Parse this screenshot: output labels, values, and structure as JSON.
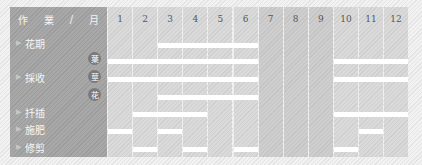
{
  "chart_data": {
    "type": "gantt",
    "title": "",
    "header_label": [
      "作",
      "業",
      "/",
      "月"
    ],
    "months": [
      "1",
      "2",
      "3",
      "4",
      "5",
      "6",
      "7",
      "8",
      "9",
      "10",
      "11",
      "12"
    ],
    "shaded_months": [
      7,
      8,
      9
    ],
    "rows": [
      {
        "task": "花期",
        "sub": "",
        "y": 36,
        "months": [
          3,
          4,
          5,
          6
        ]
      },
      {
        "task": "採收",
        "sub": "葉",
        "y": 52,
        "months": [
          1,
          2,
          3,
          4,
          5,
          6,
          10,
          11,
          12
        ]
      },
      {
        "task": "",
        "sub": "莖",
        "y": 70,
        "months": [
          1,
          2,
          3,
          4,
          5,
          6,
          10,
          11,
          12
        ]
      },
      {
        "task": "",
        "sub": "花",
        "y": 88,
        "months": [
          3,
          4,
          5,
          6
        ]
      },
      {
        "task": "扦插",
        "sub": "",
        "y": 105,
        "months": [
          2,
          3,
          4,
          10,
          11,
          12
        ]
      },
      {
        "task": "施肥",
        "sub": "",
        "y": 122,
        "months": [
          1,
          3,
          11
        ]
      },
      {
        "task": "修剪",
        "sub": "",
        "y": 140,
        "months": [
          2,
          4,
          6,
          10
        ]
      }
    ]
  },
  "labels": {
    "header": {
      "c1": "作",
      "c2": "業",
      "c3": "/",
      "c4": "月"
    },
    "flowering": "花期",
    "harvest": "採收",
    "harvest_leaf": "葉",
    "harvest_stem": "莖",
    "harvest_flower": "花",
    "cutting": "扦插",
    "fertilize": "施肥",
    "pruning": "修剪"
  },
  "colors": {
    "label_column": "#a2a2a2",
    "grid": "#d5d5d5",
    "bar": "#ffffff",
    "badge": "#7a7a7a"
  }
}
